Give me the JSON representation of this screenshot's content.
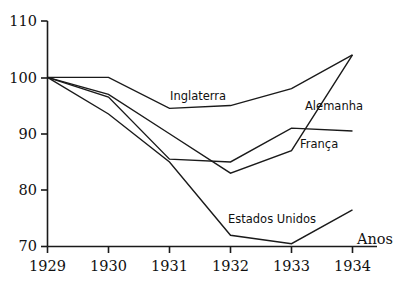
{
  "chart_data": {
    "type": "line",
    "title": "",
    "subtitle": "",
    "xlabel": "Anos",
    "ylabel": "",
    "x": [
      1929,
      1930,
      1931,
      1932,
      1933,
      1934
    ],
    "categories": [
      "1929",
      "1930",
      "1931",
      "1932",
      "1933",
      "1934"
    ],
    "xlim": [
      1929,
      1934
    ],
    "ylim": [
      70,
      110
    ],
    "yticks": [
      70,
      80,
      90,
      100,
      110
    ],
    "ytick_labels": [
      "70",
      "80",
      "90",
      "100",
      "110"
    ],
    "xtick_labels": [
      "1929",
      "1930",
      "1931",
      "1932",
      "1933",
      "1934"
    ],
    "grid": false,
    "legend_position": "inline-annotations",
    "line_color": "#1a1a1a",
    "background_color": "#ffffff",
    "series": [
      {
        "name": "Inglaterra",
        "values": [
          100,
          100,
          94.5,
          95,
          98,
          104
        ]
      },
      {
        "name": "Alemanha",
        "values": [
          100,
          97,
          90,
          83,
          87,
          104
        ]
      },
      {
        "name": "França",
        "values": [
          100,
          96.5,
          85.5,
          85,
          91,
          90.5
        ]
      },
      {
        "name": "Estados Unidos",
        "values": [
          100,
          93.5,
          85,
          72,
          70.5,
          76.5
        ]
      }
    ],
    "annotations": [
      {
        "text": "Inglaterra",
        "x": 170,
        "y": 100
      },
      {
        "text": "Alemanha",
        "x": 305,
        "y": 110
      },
      {
        "text": "França",
        "x": 300,
        "y": 148
      },
      {
        "text": "Estados Unidos",
        "x": 228,
        "y": 223
      }
    ]
  },
  "axis": {
    "x_name": "Anos",
    "y_tick_0": "70",
    "y_tick_1": "80",
    "y_tick_2": "90",
    "y_tick_3": "100",
    "y_tick_4": "110",
    "x_tick_0": "1929",
    "x_tick_1": "1930",
    "x_tick_2": "1931",
    "x_tick_3": "1932",
    "x_tick_4": "1933",
    "x_tick_5": "1934"
  },
  "labels": {
    "inglaterra": "Inglaterra",
    "alemanha": "Alemanha",
    "franca": "França",
    "estados_unidos": "Estados Unidos"
  }
}
